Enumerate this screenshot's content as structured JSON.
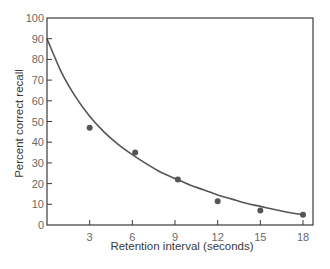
{
  "chart_data": {
    "type": "scatter",
    "title": "",
    "xlabel": "Retention interval (seconds)",
    "ylabel": "Percent correct recall",
    "xlim": [
      0,
      19.2
    ],
    "ylim": [
      0,
      100
    ],
    "x_ticks": [
      3,
      6,
      9,
      12,
      15,
      18
    ],
    "y_ticks": [
      0,
      10,
      20,
      30,
      40,
      50,
      60,
      70,
      80,
      90,
      100
    ],
    "grid": false,
    "legend": null,
    "series": [
      {
        "name": "Observed recall",
        "style": "points",
        "x": [
          3,
          6.2,
          9.2,
          12,
          15,
          18
        ],
        "y": [
          47,
          35,
          22,
          11.5,
          7,
          5
        ]
      },
      {
        "name": "Fitted curve",
        "style": "line",
        "x": [
          0,
          1,
          2,
          3,
          4,
          5,
          6,
          7,
          8,
          9,
          10,
          11,
          12,
          13,
          14,
          15,
          16,
          17,
          18
        ],
        "y": [
          90,
          74,
          62,
          52.5,
          45,
          39,
          34,
          29.5,
          25.5,
          22.5,
          19.5,
          17,
          14.5,
          12.5,
          10.5,
          9,
          7.5,
          6,
          5
        ]
      }
    ]
  },
  "colors": {
    "axis": "#3a3a3a",
    "curve": "#555555",
    "points": "#555555",
    "tick_text": "#6a6a6a"
  }
}
